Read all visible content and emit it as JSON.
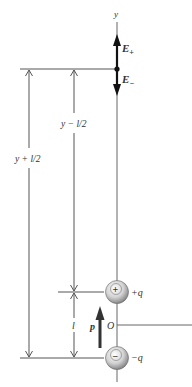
{
  "diagram": {
    "type": "electric-dipole-field-on-axis",
    "axis_label": "y",
    "field_labels": {
      "e_plus": "E",
      "e_plus_sub": "+",
      "e_minus": "E",
      "e_minus_sub": "−"
    },
    "distances": {
      "far": "y + l/2",
      "near": "y − l/2",
      "separation": "l"
    },
    "charges": {
      "positive": {
        "symbol": "+",
        "label": "+q"
      },
      "negative": {
        "symbol": "−",
        "label": "−q"
      }
    },
    "origin_label": "O",
    "dipole_moment_label": "p",
    "colors": {
      "line": "#555555",
      "field_arrow": "#111111",
      "dipole_arrow": "#333333",
      "sphere_light": "#ffffff",
      "sphere_dark": "#8a8a8a"
    }
  }
}
